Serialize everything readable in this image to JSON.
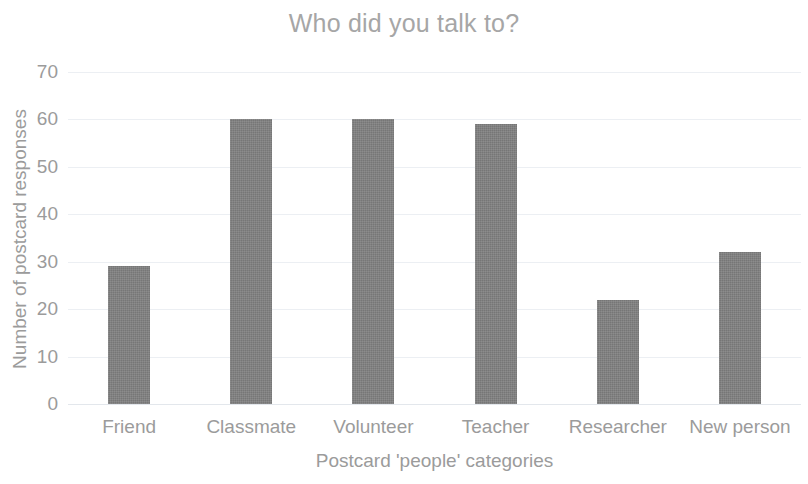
{
  "chart_data": {
    "type": "bar",
    "title": "Who did you talk to?",
    "xlabel": "Postcard 'people' categories",
    "ylabel": "Number of postcard responses",
    "categories": [
      "Friend",
      "Classmate",
      "Volunteer",
      "Teacher",
      "Researcher",
      "New person"
    ],
    "values": [
      29,
      60,
      60,
      59,
      22,
      32
    ],
    "ylim": [
      0,
      70
    ],
    "ytick_labels": [
      "70",
      "60",
      "50",
      "40",
      "30",
      "20",
      "10",
      "0"
    ],
    "ytick_values": [
      70,
      60,
      50,
      40,
      30,
      20,
      10,
      0
    ],
    "grid": true,
    "legend": false,
    "bar_color": "#808080",
    "text_color": "#9b9b9b",
    "title_color": "#a6a6a6",
    "gridline_color": "#eceff3"
  }
}
